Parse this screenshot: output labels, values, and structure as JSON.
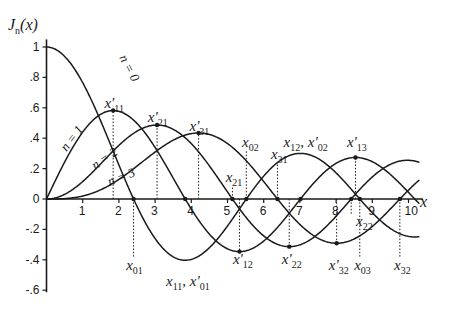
{
  "chart_data": {
    "type": "line",
    "title": "",
    "ylabel": "J_n(x)",
    "xlabel": "x",
    "xlim": [
      0,
      10.3
    ],
    "ylim": [
      -0.6,
      1.0
    ],
    "grid": false,
    "x_ticks": [
      1,
      2,
      3,
      4,
      5,
      6,
      7,
      8,
      9,
      10
    ],
    "x_tick_labels": [
      "1",
      "2",
      "3",
      "4",
      "5",
      "6",
      "7",
      "8",
      "9",
      "10"
    ],
    "y_ticks": [
      1,
      0.8,
      0.6,
      0.4,
      0.2,
      0,
      -0.2,
      -0.4,
      -0.6
    ],
    "y_tick_labels": [
      "1",
      ".8",
      ".6",
      ".4",
      ".2",
      "0",
      "-.2",
      "-.4",
      "-.6"
    ],
    "series": [
      {
        "name": "n = 0",
        "order": 0,
        "label_pos": [
          2.0,
          0.93
        ],
        "label_rot": 62
      },
      {
        "name": "n = 1",
        "order": 1,
        "label_pos": [
          0.55,
          0.31
        ],
        "label_rot": -52
      },
      {
        "name": "n = 2",
        "order": 2,
        "label_pos": [
          1.35,
          0.19
        ],
        "label_rot": -35
      },
      {
        "name": "n = 3",
        "order": 3,
        "label_pos": [
          1.75,
          0.085
        ],
        "label_rot": -22
      }
    ],
    "annotations": [
      {
        "label": "x'",
        "sub": "11",
        "x": 1.841,
        "n": 1,
        "kind": "max",
        "text_pos": [
          1.6,
          0.6
        ]
      },
      {
        "label": "x'",
        "sub": "21",
        "x": 3.054,
        "n": 2,
        "kind": "max",
        "text_pos": [
          2.8,
          0.505
        ]
      },
      {
        "label": "x'",
        "sub": "31",
        "x": 4.201,
        "n": 3,
        "kind": "max",
        "text_pos": [
          3.95,
          0.45
        ]
      },
      {
        "label": "x",
        "sub": "01",
        "x": 2.405,
        "n": 0,
        "kind": "zero",
        "text_pos": [
          2.2,
          -0.47
        ]
      },
      {
        "label": "x",
        "sub": "02",
        "x": 5.52,
        "n": 0,
        "kind": "zero",
        "text_pos": [
          5.4,
          0.34
        ]
      },
      {
        "label": "x",
        "sub": "03",
        "x": 8.654,
        "n": 0,
        "kind": "zero",
        "text_pos": [
          8.5,
          -0.47
        ]
      },
      {
        "label": "x",
        "sub": "21",
        "x": 5.136,
        "n": 2,
        "kind": "zero",
        "text_pos": [
          4.95,
          0.115
        ]
      },
      {
        "label": "x",
        "sub": "31",
        "x": 6.38,
        "n": 3,
        "kind": "zero",
        "text_pos": [
          6.2,
          0.265
        ]
      },
      {
        "label": "x",
        "sub": "22",
        "x": 8.417,
        "n": 2,
        "kind": "zero",
        "text_pos": [
          8.55,
          -0.18
        ]
      },
      {
        "label": "x",
        "sub": "32",
        "x": 9.761,
        "n": 3,
        "kind": "zero",
        "text_pos": [
          9.6,
          -0.47
        ]
      },
      {
        "label": "x",
        "sub": "12, x'02",
        "x": 7.016,
        "n": 1,
        "kind": "max",
        "text_pos": [
          6.55,
          0.34
        ]
      },
      {
        "label": "x'",
        "sub": "13",
        "x": 8.536,
        "n": 1,
        "kind": "max",
        "text_pos": [
          8.3,
          0.34
        ]
      },
      {
        "label": "x'",
        "sub": "12",
        "x": 5.331,
        "n": 1,
        "kind": "min",
        "text_pos": [
          5.15,
          -0.43
        ]
      },
      {
        "label": "x'",
        "sub": "22",
        "x": 6.706,
        "n": 2,
        "kind": "min",
        "text_pos": [
          6.5,
          -0.43
        ]
      },
      {
        "label": "x'",
        "sub": "32",
        "x": 8.015,
        "n": 3,
        "kind": "min",
        "text_pos": [
          7.8,
          -0.47
        ]
      },
      {
        "label": "x",
        "sub": "11, x'01",
        "x": 3.832,
        "n": 1,
        "kind": "min",
        "text_pos": [
          3.3,
          -0.57
        ]
      }
    ]
  },
  "axes": {
    "y_title": "J",
    "y_title_sub": "n",
    "y_title_suffix": "(x)",
    "x_title": "x"
  }
}
